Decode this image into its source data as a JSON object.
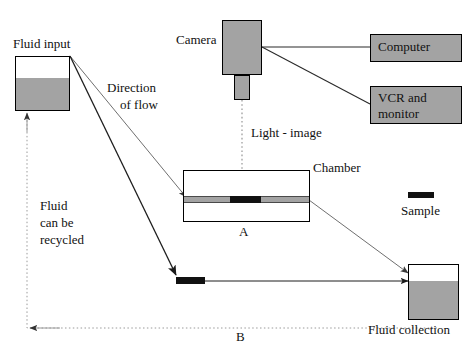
{
  "diagram": {
    "colors": {
      "fill_gray": "#a3a3a3",
      "sample_black": "#111111",
      "line_dark": "#222222",
      "line_light": "#888888",
      "dotted": "#9a9a9a",
      "stroke": "#000000"
    },
    "labels": {
      "fluid_input": "Fluid input",
      "direction_of_flow_line1": "Direction",
      "direction_of_flow_line2": "of flow",
      "camera": "Camera",
      "computer": "Computer",
      "vcr_line1": "VCR and",
      "vcr_line2": "monitor",
      "light_image": "Light - image",
      "chamber": "Chamber",
      "point_a": "A",
      "point_b": "B",
      "sample": "Sample",
      "fluid_collection": "Fluid collection",
      "recycled_line1": "Fluid",
      "recycled_line2": "can be",
      "recycled_line3": "recycled"
    },
    "components": [
      {
        "name": "fluid-input-reservoir",
        "fill": "#a3a3a3",
        "fill_level_percent": 60
      },
      {
        "name": "camera-body",
        "fill": "#a3a3a3"
      },
      {
        "name": "camera-lens",
        "fill": "#a3a3a3"
      },
      {
        "name": "computer-box",
        "fill": "#a3a3a3"
      },
      {
        "name": "vcr-monitor-box",
        "fill": "#a3a3a3"
      },
      {
        "name": "flow-chamber",
        "fill": "#ffffff"
      },
      {
        "name": "chamber-channel",
        "fill": "#a3a3a3"
      },
      {
        "name": "sample-in-chamber",
        "fill": "#111111"
      },
      {
        "name": "sample-at-point-b",
        "fill": "#111111"
      },
      {
        "name": "sample-legend-swatch",
        "fill": "#111111"
      },
      {
        "name": "fluid-collection-reservoir",
        "fill": "#a3a3a3",
        "fill_level_percent": 72
      }
    ]
  }
}
